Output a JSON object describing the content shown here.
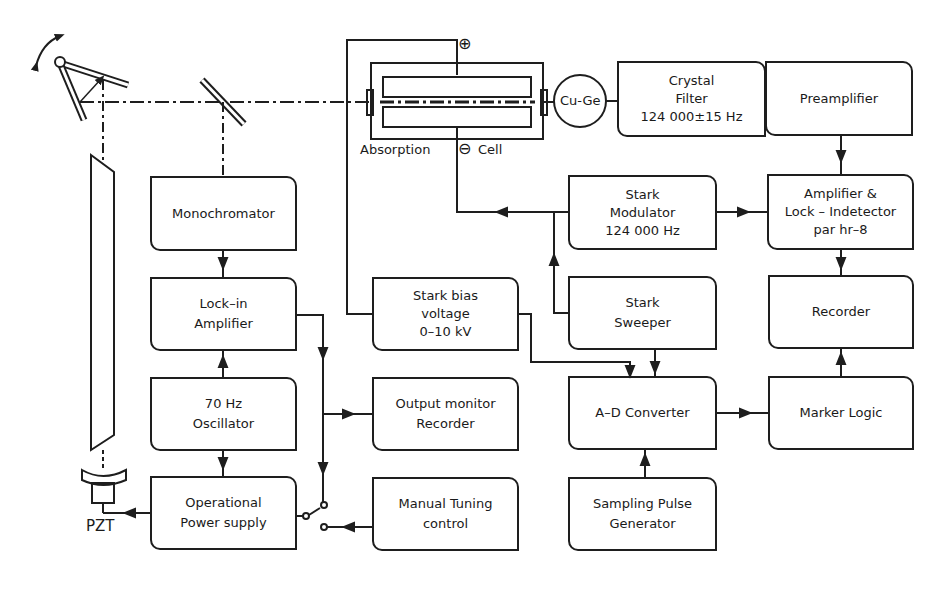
{
  "diagram": {
    "line_color": "#1e1e1e",
    "background": "#ffffff"
  },
  "blocks": {
    "monochromator": {
      "lines": [
        "Monochromator"
      ]
    },
    "lockin": {
      "lines": [
        "Lock–in",
        "Amplifier"
      ]
    },
    "oscillator": {
      "lines": [
        "70 Hz",
        "Oscillator"
      ]
    },
    "power": {
      "lines": [
        "Operational",
        "Power supply"
      ]
    },
    "stark_bias": {
      "lines": [
        "Stark bias",
        "voltage",
        "0–10 kV"
      ]
    },
    "output_monitor": {
      "lines": [
        "Output monitor",
        "Recorder"
      ]
    },
    "manual_tuning": {
      "lines": [
        "Manual Tuning",
        "control"
      ]
    },
    "stark_modulator": {
      "lines": [
        "Stark",
        "Modulator",
        "124 000 Hz"
      ]
    },
    "stark_sweeper": {
      "lines": [
        "Stark",
        "Sweeper"
      ]
    },
    "ad_converter": {
      "lines": [
        "A–D Converter"
      ]
    },
    "sampling_pulse": {
      "lines": [
        "Sampling Pulse",
        "Generator"
      ]
    },
    "crystal_filter": {
      "lines": [
        "Crystal",
        "Filter",
        "124 000±15 Hz"
      ]
    },
    "preamplifier": {
      "lines": [
        "Preamplifier"
      ]
    },
    "amp_lock": {
      "lines": [
        "Amplifier &",
        "Lock – Indetector",
        "par  hr–8"
      ]
    },
    "recorder": {
      "lines": [
        "Recorder"
      ]
    },
    "marker_logic": {
      "lines": [
        "Marker Logic"
      ]
    }
  },
  "labels": {
    "absorption": "Absorption",
    "cell": "Cell",
    "detector": "Cu-Ge",
    "pzt": "PZT",
    "plus_symbol": "⊕",
    "minus_symbol": "⊖"
  }
}
